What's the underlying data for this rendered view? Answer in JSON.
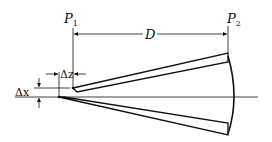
{
  "diagram": {
    "labels": {
      "p1": "P",
      "p1_sub": "1",
      "p2": "P",
      "p2_sub": "2",
      "distance": "D",
      "delta_z": "Δz",
      "delta_x": "Δx"
    },
    "colors": {
      "stroke": "#111111",
      "background": "#ffffff"
    }
  }
}
